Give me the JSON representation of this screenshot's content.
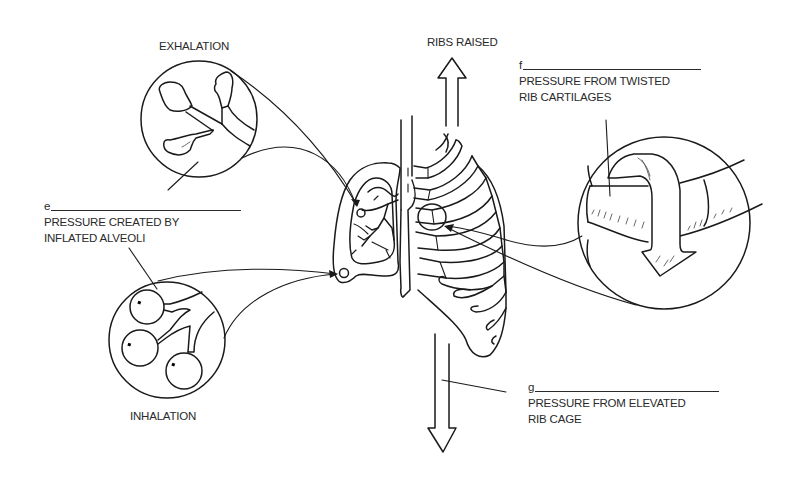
{
  "diagram": {
    "labels": {
      "exhalation": "EXHALATION",
      "inhalation": "INHALATION",
      "ribs_raised": "RIBS RAISED"
    },
    "blanks": [
      {
        "letter": "e",
        "caption_line1": "PRESSURE CREATED BY",
        "caption_line2": "INFLATED ALVEOLI"
      },
      {
        "letter": "f",
        "caption_line1": "PRESSURE FROM TWISTED",
        "caption_line2": "RIB CARTILAGES"
      },
      {
        "letter": "g",
        "caption_line1": "PRESSURE FROM ELEVATED",
        "caption_line2": "RIB CAGE"
      }
    ],
    "callouts": [
      {
        "name": "exhalation-detail",
        "shape": "circle",
        "content": "deflated alveoli"
      },
      {
        "name": "inhalation-detail",
        "shape": "circle",
        "content": "inflated alveoli"
      },
      {
        "name": "rib-cartilage-detail",
        "shape": "circle",
        "content": "twisted rib cartilage with curved arrow"
      }
    ],
    "arrows": [
      {
        "name": "ribs-raised-arrow",
        "direction": "up"
      },
      {
        "name": "downward-arrow",
        "direction": "down"
      }
    ]
  }
}
